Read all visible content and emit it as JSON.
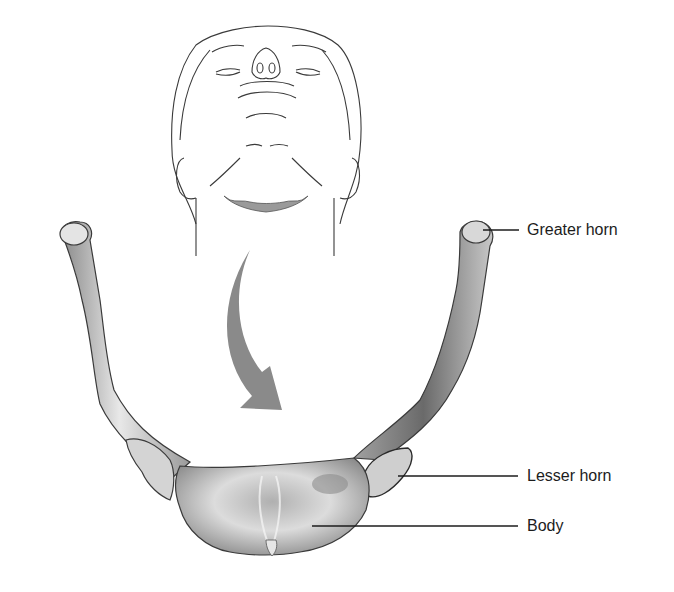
{
  "figure": {
    "view": "Anterior view with inset of head tilted back showing hyoid location",
    "labels": [
      {
        "id": "greater-horn",
        "text": "Greater horn"
      },
      {
        "id": "lesser-horn",
        "text": "Lesser horn"
      },
      {
        "id": "body",
        "text": "Body"
      }
    ],
    "colors": {
      "line_art": "#3a3a3a",
      "bone_light": "#e6e6e6",
      "bone_mid": "#b8b8b8",
      "bone_dark": "#6e6e6e",
      "arrow": "#8a8a8a",
      "hyoid_highlight": "#9a9a9a",
      "leader_line": "#1c1c1c"
    }
  }
}
